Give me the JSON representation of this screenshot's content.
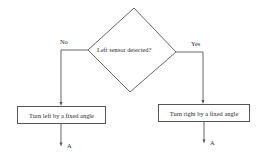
{
  "flowchart": {
    "decision": {
      "label": "Left sensor detected?"
    },
    "branches": {
      "no": {
        "label": "No",
        "action": "Turn left by a fixed angle",
        "connector": "A"
      },
      "yes": {
        "label": "Yes",
        "action": "Turn right by a fixed angle",
        "connector": "A"
      }
    }
  },
  "colors": {
    "line": "#555555",
    "text": "#2a2a2a",
    "background": "#ffffff"
  }
}
